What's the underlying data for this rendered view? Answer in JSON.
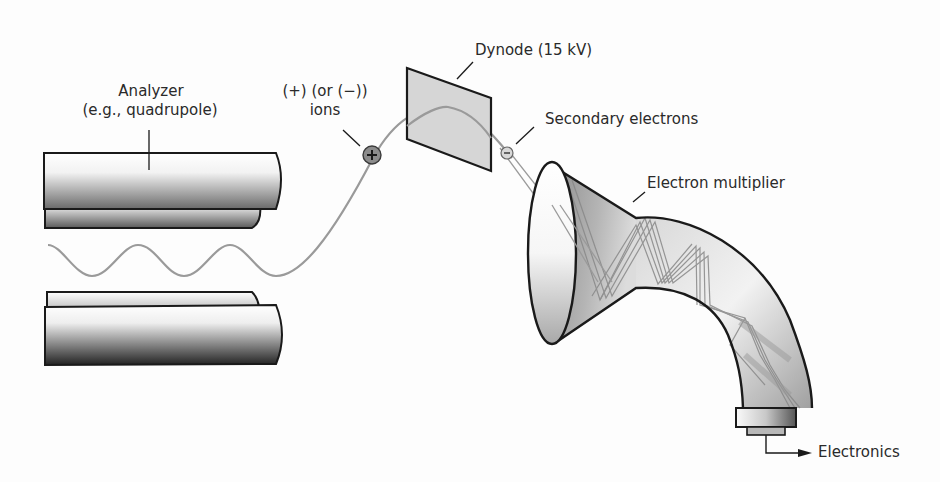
{
  "diagram": {
    "labels": {
      "analyzer_line1": "Analyzer",
      "analyzer_line2": "(e.g., quadrupole)",
      "ions_line1": "(+) (or (−))",
      "ions_line2": "ions",
      "dynode": "Dynode (15 kV)",
      "secondary_electrons": "Secondary electrons",
      "electron_multiplier": "Electron multiplier",
      "electronics": "Electronics"
    },
    "symbols": {
      "positive_ion": "+",
      "electron": "−"
    },
    "colors": {
      "outline": "#1a1a1a",
      "trajectory": "#9a9a9a",
      "ion_fill": "#8c8c8c",
      "dynode_fill": "#d4d4d4",
      "multiplier_dark": "#7a7a7a",
      "multiplier_light": "#f0f0f0",
      "text": "#2a2a2a"
    },
    "components": [
      "analyzer-rods",
      "ion-trajectory",
      "dynode",
      "secondary-electron-path",
      "electron-multiplier",
      "collector",
      "electronics-output"
    ]
  }
}
